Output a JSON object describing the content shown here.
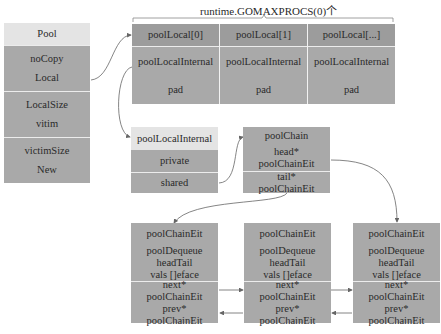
{
  "title": "runtime.GOMAXPROCS(0)个",
  "pool": {
    "header": "Pool",
    "fields": [
      "noCopy",
      "Local",
      "LocalSize",
      "vitim",
      "victimSize",
      "New"
    ]
  },
  "pool_local_array": {
    "columns": [
      {
        "header": "poolLocal[0]",
        "internal": "poolLocalInternal",
        "pad": "pad"
      },
      {
        "header": "poolLocal[1]",
        "internal": "poolLocalInternal",
        "pad": "pad"
      },
      {
        "header": "poolLocal[...]",
        "internal": "poolLocalInternal",
        "pad": "pad"
      }
    ]
  },
  "pool_local_internal": {
    "header": "poolLocalInternal",
    "fields": [
      "private",
      "shared"
    ]
  },
  "pool_chain": {
    "header": "poolChain",
    "head_line1": "head*",
    "head_line2": "poolChainEit",
    "tail_line1": "tail*",
    "tail_line2": "poolChainEit"
  },
  "chain_elements": [
    {
      "header": "poolChainEit",
      "dq1": "poolDequeue",
      "dq2": "headTail",
      "dq3": "vals []eface",
      "next1": "next*",
      "next2": "poolChainEit",
      "prev1": "prev*",
      "prev2": "poolChainEit"
    },
    {
      "header": "poolChainEit",
      "dq1": "poolDequeue",
      "dq2": "headTail",
      "dq3": "vals []eface",
      "next1": "next*",
      "next2": "poolChainEit",
      "prev1": "prev*",
      "prev2": "poolChainEit"
    },
    {
      "header": "poolChainEit",
      "dq1": "poolDequeue",
      "dq2": "headTail",
      "dq3": "vals []eface",
      "next1": "next*",
      "next2": "poolChainEit",
      "prev1": "prev*",
      "prev2": "poolChainEit"
    }
  ],
  "colors": {
    "light_header": "#e4e4e4",
    "body": "#a9a9a9",
    "array_header": "#9c9c9c",
    "arrow": "#666666"
  }
}
